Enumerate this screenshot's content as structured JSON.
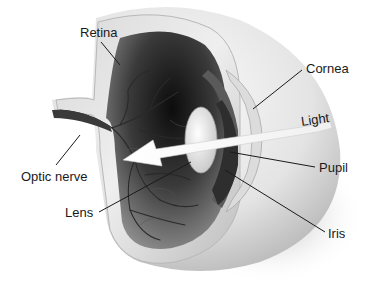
{
  "figure": {
    "labels": [
      {
        "id": "retina",
        "text": "Retina",
        "x": 80,
        "y": 25
      },
      {
        "id": "cornea",
        "text": "Cornea",
        "x": 306,
        "y": 62
      },
      {
        "id": "light",
        "text": "Light",
        "x": 302,
        "y": 117
      },
      {
        "id": "optic-nerve",
        "text": "Optic nerve",
        "x": 20,
        "y": 170
      },
      {
        "id": "pupil",
        "text": "Pupil",
        "x": 319,
        "y": 160
      },
      {
        "id": "lens",
        "text": "Lens",
        "x": 65,
        "y": 205
      },
      {
        "id": "iris",
        "text": "Iris",
        "x": 328,
        "y": 226
      }
    ],
    "colors": {
      "background": "#ffffff",
      "sclera_light": "#f0f0f0",
      "sclera_mid": "#c8c8c8",
      "interior_dark": "#1a1a1a",
      "interior_mid": "#6a6a6a",
      "vessel": "#2a2a2a",
      "leader_line": "#1a1a1a",
      "text": "#1a1a1a"
    }
  }
}
